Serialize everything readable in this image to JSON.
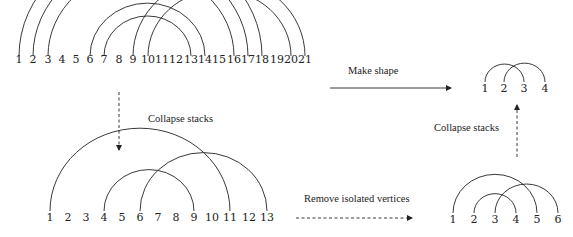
{
  "graphs": [
    {
      "id": "original",
      "baseline_y": 56,
      "label_y": 54,
      "vertices": [
        {
          "label": "1",
          "x": 19
        },
        {
          "label": "2",
          "x": 33
        },
        {
          "label": "3",
          "x": 48
        },
        {
          "label": "4",
          "x": 62
        },
        {
          "label": "5",
          "x": 76
        },
        {
          "label": "6",
          "x": 90
        },
        {
          "label": "7",
          "x": 104
        },
        {
          "label": "8",
          "x": 119
        },
        {
          "label": "9",
          "x": 133
        },
        {
          "label": "10",
          "x": 148
        },
        {
          "label": "11",
          "x": 162
        },
        {
          "label": "12",
          "x": 176
        },
        {
          "label": "13",
          "x": 191
        },
        {
          "label": "14",
          "x": 205
        },
        {
          "label": "15",
          "x": 219
        },
        {
          "label": "16",
          "x": 234
        },
        {
          "label": "17",
          "x": 248
        },
        {
          "label": "18",
          "x": 262
        },
        {
          "label": "19",
          "x": 277
        },
        {
          "label": "20",
          "x": 291
        },
        {
          "label": "21",
          "x": 305
        }
      ],
      "arcs": [
        [
          1,
          18
        ],
        [
          2,
          17
        ],
        [
          3,
          16
        ],
        [
          6,
          14
        ],
        [
          7,
          13
        ],
        [
          9,
          21
        ],
        [
          10,
          20
        ]
      ]
    },
    {
      "id": "collapsed",
      "baseline_y": 211,
      "label_y": 212,
      "vertices": [
        {
          "label": "1",
          "x": 50
        },
        {
          "label": "2",
          "x": 68
        },
        {
          "label": "3",
          "x": 86
        },
        {
          "label": "4",
          "x": 104
        },
        {
          "label": "5",
          "x": 122
        },
        {
          "label": "6",
          "x": 140
        },
        {
          "label": "7",
          "x": 158
        },
        {
          "label": "8",
          "x": 176
        },
        {
          "label": "9",
          "x": 194
        },
        {
          "label": "10",
          "x": 212
        },
        {
          "label": "11",
          "x": 230
        },
        {
          "label": "12",
          "x": 249
        },
        {
          "label": "13",
          "x": 267
        }
      ],
      "arcs": [
        [
          1,
          11
        ],
        [
          4,
          9
        ],
        [
          6,
          13
        ]
      ]
    },
    {
      "id": "isolated-removed",
      "baseline_y": 213,
      "label_y": 214,
      "vertices": [
        {
          "label": "1",
          "x": 453
        },
        {
          "label": "2",
          "x": 474
        },
        {
          "label": "3",
          "x": 495
        },
        {
          "label": "4",
          "x": 516
        },
        {
          "label": "5",
          "x": 537
        },
        {
          "label": "6",
          "x": 558
        }
      ],
      "arcs": [
        [
          1,
          5
        ],
        [
          2,
          4
        ],
        [
          3,
          6
        ]
      ]
    },
    {
      "id": "shape",
      "baseline_y": 82,
      "label_y": 83,
      "vertices": [
        {
          "label": "1",
          "x": 485
        },
        {
          "label": "2",
          "x": 504
        },
        {
          "label": "3",
          "x": 524
        },
        {
          "label": "4",
          "x": 545
        }
      ],
      "arcs": [
        [
          1,
          3
        ],
        [
          2,
          4
        ]
      ]
    }
  ],
  "transitions": [
    {
      "id": "make-shape",
      "label": "Make shape",
      "style": "solid",
      "from": [
        330,
        88
      ],
      "to": [
        451,
        88
      ],
      "label_pos": [
        348,
        69
      ]
    },
    {
      "id": "collapse-stacks-down",
      "label": "Collapse stacks",
      "style": "dashed",
      "from": [
        119,
        92
      ],
      "to": [
        119,
        150
      ],
      "label_pos": [
        148,
        118
      ]
    },
    {
      "id": "remove-isolated",
      "label": "Remove isolated vertices",
      "style": "dashed",
      "from": [
        296,
        218
      ],
      "to": [
        412,
        218
      ],
      "label_pos": [
        304,
        197
      ]
    },
    {
      "id": "collapse-stacks-up",
      "label": "Collapse stacks",
      "style": "dashed",
      "from": [
        517,
        157
      ],
      "to": [
        517,
        105
      ],
      "label_pos": [
        434,
        127
      ]
    }
  ],
  "colors": {
    "line": "#222222",
    "text": "#222222",
    "background": "#ffffff"
  }
}
